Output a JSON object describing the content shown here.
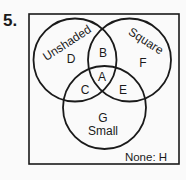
{
  "problem": {
    "number": "5."
  },
  "diagram": {
    "type": "venn",
    "sets": {
      "unshaded": {
        "label": "Unshaded",
        "region": "D"
      },
      "square": {
        "label": "Square",
        "region": "F"
      },
      "small": {
        "label": "Small",
        "region": "G"
      }
    },
    "regions": {
      "A": "A",
      "B": "B",
      "C": "C",
      "D": "D",
      "E": "E",
      "F": "F",
      "G": "G"
    },
    "none_label": "None: H"
  },
  "colors": {
    "stroke": "#1a1a1a",
    "background": "#fafafa"
  }
}
